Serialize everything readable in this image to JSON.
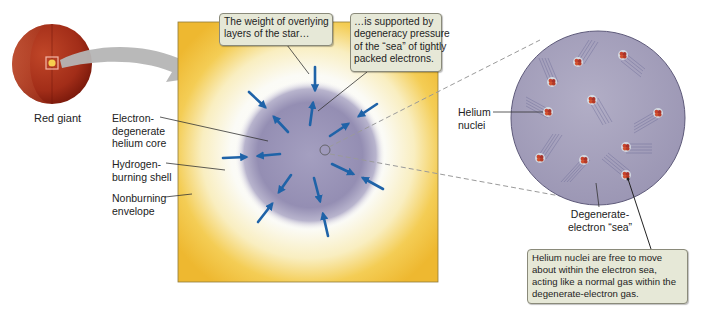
{
  "red_giant": {
    "label": "Red giant",
    "colors": {
      "surface": "#a8301a",
      "interior": "#8e1e10",
      "core": "#f3c94a"
    }
  },
  "core_panel": {
    "colors": {
      "envelope": "#f2c23c",
      "shell": "#fbfbf6",
      "core": "#958fb4",
      "arrow": "#1f63a8"
    },
    "labels": {
      "electron_degenerate_core": [
        "Electron-",
        "degenerate",
        "helium core"
      ],
      "hydrogen_burning_shell": [
        "Hydrogen-",
        "burning shell"
      ],
      "nonburning_envelope": [
        "Nonburning",
        "envelope"
      ]
    },
    "callouts": {
      "weight": [
        "The weight of overlying",
        "layers of the star…"
      ],
      "support": [
        "…is supported by",
        "degeneracy pressure",
        "of the “sea” of tightly",
        "packed electrons."
      ]
    },
    "arrows": {
      "inward_count": 7,
      "outward_count": 7
    }
  },
  "zoom_panel": {
    "colors": {
      "sea": "#a7a3bd",
      "nucleus": "#c8432b",
      "trail": "#6b6a95"
    },
    "labels": {
      "helium_nuclei": [
        "Helium",
        "nuclei"
      ],
      "degenerate_sea": [
        "Degenerate-",
        "electron “sea”"
      ]
    },
    "callout": [
      "Helium nuclei are free to move",
      "about within the electron sea,",
      "acting like a normal gas within the",
      "degenerate-electron gas."
    ],
    "nuclei_count": 10
  }
}
